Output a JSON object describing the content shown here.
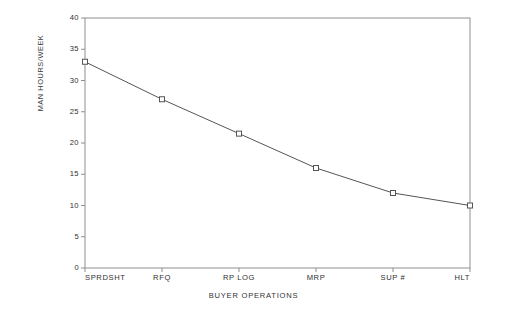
{
  "chart_data": {
    "type": "line",
    "title": "",
    "xlabel": "BUYER OPERATIONS",
    "ylabel": "MAN HOURS/WEEK",
    "categories": [
      "SPRDSHT",
      "RFQ",
      "RP LOG",
      "MRP",
      "SUP #",
      "HLT"
    ],
    "values": [
      33,
      27,
      21.5,
      16,
      12,
      10
    ],
    "series": [
      {
        "name": "MAN HOURS/WEEK",
        "values": [
          33,
          27,
          21.5,
          16,
          12,
          10
        ]
      }
    ],
    "ylim": [
      0,
      40
    ],
    "yticks": [
      0,
      5,
      10,
      15,
      20,
      25,
      30,
      35,
      40
    ],
    "ytick_labels": [
      "0",
      "5",
      "10",
      "15",
      "20",
      "25",
      "30",
      "35",
      "40"
    ],
    "grid": false,
    "legend": null,
    "legend_position": "none",
    "marker": "open-square",
    "line_color": "#555555",
    "marker_color": "#555555",
    "axis_color": "#8a8a8a",
    "background_color": "#ffffff",
    "annotations": []
  }
}
